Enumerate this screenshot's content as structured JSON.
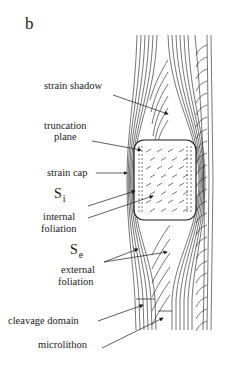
{
  "panel_label": "b",
  "labels": {
    "strain_shadow": "strain shadow",
    "truncation_plane": [
      "truncation",
      "plane"
    ],
    "strain_cap": "strain cap",
    "si": {
      "symbol": "S",
      "subscript": "i",
      "line1": "internal",
      "line2": "foliation"
    },
    "se": {
      "symbol": "S",
      "subscript": "e",
      "line1": "external",
      "line2": "foliation"
    },
    "cleavage_domain": "cleavage domain",
    "microlithon": "microlithon"
  },
  "colors": {
    "ink": "#1a1a1a",
    "background": "#ffffff"
  }
}
